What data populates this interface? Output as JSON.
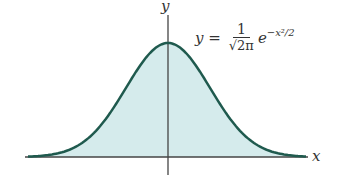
{
  "chart_data": {
    "type": "area",
    "equation": {
      "lhs": "y",
      "numerator": "1",
      "denominator": "√2π",
      "exp_base": "e",
      "exponent": "−x²/2"
    },
    "xlabel": "x",
    "ylabel": "y",
    "curve": "y = exp(-x^2/2)/sqrt(2π)",
    "grid": false,
    "fill_color": "#d5ebec",
    "line_color": "#1f5a4e"
  },
  "labels": {
    "x": "x",
    "y": "y",
    "lhs": "y =",
    "num": "1",
    "den": "√2π",
    "e": "e",
    "exp": "−x²/2"
  }
}
